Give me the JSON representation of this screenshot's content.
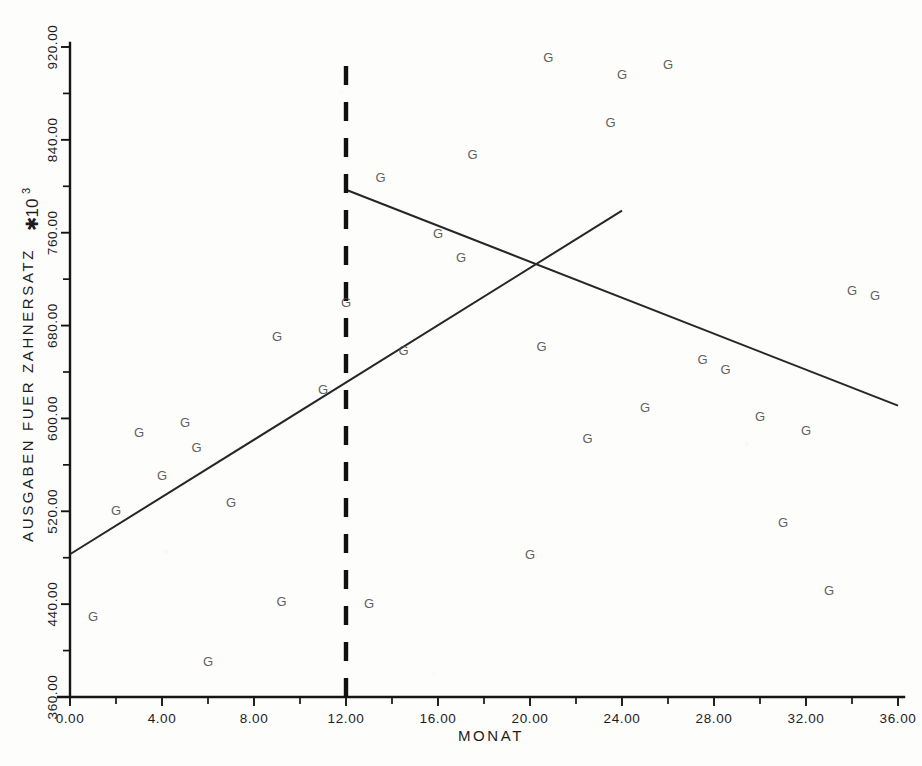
{
  "chart_data": {
    "type": "scatter",
    "title": "",
    "xlabel": "MONAT",
    "ylabel": "AUSGABEN FUER ZAHNERSATZ",
    "y_multiplier_label": "✱10",
    "y_multiplier_exponent": "3",
    "xlim": [
      0,
      36
    ],
    "ylim": [
      360,
      920
    ],
    "grid": false,
    "legend": false,
    "marker_glyph": "G",
    "x_ticks": [
      0,
      4,
      8,
      12,
      16,
      20,
      24,
      28,
      32,
      36
    ],
    "x_tick_labels": [
      "0.00",
      "4.00",
      "8.00",
      "12.00",
      "16.00",
      "20.00",
      "24.00",
      "28.00",
      "32.00",
      "36.00"
    ],
    "x_minor_ticks": [
      2,
      6,
      10,
      14,
      18,
      22,
      26,
      30,
      34
    ],
    "y_ticks": [
      360,
      440,
      520,
      600,
      680,
      760,
      840,
      920
    ],
    "y_tick_labels": [
      "360.00",
      "440.00",
      "520.00",
      "600.00",
      "680.00",
      "760.00",
      "840.00",
      "920.00"
    ],
    "y_minor_ticks": [
      400,
      480,
      560,
      640,
      720,
      800,
      880
    ],
    "points": [
      {
        "x": 1,
        "y": 430
      },
      {
        "x": 2,
        "y": 521
      },
      {
        "x": 3,
        "y": 588
      },
      {
        "x": 4,
        "y": 551
      },
      {
        "x": 5,
        "y": 597
      },
      {
        "x": 5.5,
        "y": 575
      },
      {
        "x": 6,
        "y": 391
      },
      {
        "x": 7,
        "y": 528
      },
      {
        "x": 9,
        "y": 671
      },
      {
        "x": 9.2,
        "y": 443
      },
      {
        "x": 11,
        "y": 625
      },
      {
        "x": 12,
        "y": 700
      },
      {
        "x": 13,
        "y": 441
      },
      {
        "x": 13.5,
        "y": 808
      },
      {
        "x": 14.5,
        "y": 659
      },
      {
        "x": 16,
        "y": 760
      },
      {
        "x": 17,
        "y": 739
      },
      {
        "x": 17.5,
        "y": 828
      },
      {
        "x": 20,
        "y": 483
      },
      {
        "x": 20.5,
        "y": 662
      },
      {
        "x": 20.8,
        "y": 911
      },
      {
        "x": 22.5,
        "y": 583
      },
      {
        "x": 23.5,
        "y": 855
      },
      {
        "x": 24,
        "y": 897
      },
      {
        "x": 25,
        "y": 610
      },
      {
        "x": 26,
        "y": 905
      },
      {
        "x": 27.5,
        "y": 651
      },
      {
        "x": 28.5,
        "y": 643
      },
      {
        "x": 30,
        "y": 602
      },
      {
        "x": 31,
        "y": 511
      },
      {
        "x": 32,
        "y": 590
      },
      {
        "x": 33,
        "y": 452
      },
      {
        "x": 34,
        "y": 711
      },
      {
        "x": 35,
        "y": 706
      }
    ],
    "series": [
      {
        "name": "pre-intervention-trend",
        "type": "line",
        "x_start": 0,
        "y_start": 483,
        "x_end": 24,
        "y_end": 779
      },
      {
        "name": "post-intervention-trend",
        "type": "line",
        "x_start": 12,
        "y_start": 797,
        "x_end": 36,
        "y_end": 611
      }
    ],
    "annotations": [
      {
        "name": "intervention-marker",
        "type": "vertical-dashed-line",
        "x": 12,
        "y_from": 360,
        "y_to": 907
      }
    ]
  }
}
